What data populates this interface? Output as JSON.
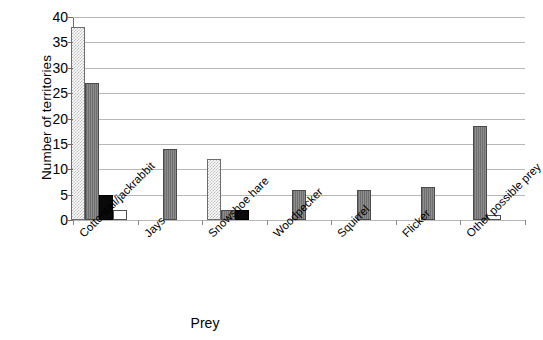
{
  "chart_data": {
    "type": "bar",
    "title": "",
    "subtitle": "",
    "xlabel": "Prey",
    "ylabel": "Number of territories",
    "ylim": [
      0,
      40
    ],
    "ytick_step": 5,
    "yticks": [
      40,
      35,
      30,
      25,
      20,
      15,
      10,
      5,
      0
    ],
    "grid": true,
    "legend": false,
    "legend_position": "none",
    "categories": [
      "Cottontail/jackrabbit",
      "Jays",
      "Snowshoe hare",
      "Woodpecker",
      "Squirrel",
      "Flicker",
      "Other possible prey"
    ],
    "series": [
      {
        "name": "series-1",
        "pattern": "light-stipple",
        "color": "#d0d0d0",
        "values": [
          38,
          null,
          12,
          null,
          null,
          null,
          null
        ]
      },
      {
        "name": "series-2",
        "pattern": "dark-gray",
        "color": "#7b7b7b",
        "values": [
          27,
          14,
          2,
          6,
          6,
          6.5,
          18.5
        ]
      },
      {
        "name": "series-3",
        "pattern": "black",
        "color": "#0a0a0a",
        "values": [
          5,
          null,
          2,
          null,
          null,
          null,
          null
        ]
      },
      {
        "name": "series-4",
        "pattern": "white",
        "color": "#ffffff",
        "values": [
          2,
          null,
          null,
          null,
          null,
          null,
          1
        ]
      }
    ],
    "bars": [
      {
        "category": "Cottontail/jackrabbit",
        "series": "series-1",
        "value": 38,
        "style": "light"
      },
      {
        "category": "Cottontail/jackrabbit",
        "series": "series-2",
        "value": 27,
        "style": "dark"
      },
      {
        "category": "Cottontail/jackrabbit",
        "series": "series-3",
        "value": 5,
        "style": "black"
      },
      {
        "category": "Cottontail/jackrabbit",
        "series": "series-4",
        "value": 2,
        "style": "white"
      },
      {
        "category": "Jays",
        "series": "series-2",
        "value": 14,
        "style": "dark"
      },
      {
        "category": "Snowshoe hare",
        "series": "series-1",
        "value": 12,
        "style": "light"
      },
      {
        "category": "Snowshoe hare",
        "series": "series-2",
        "value": 2,
        "style": "dark"
      },
      {
        "category": "Snowshoe hare",
        "series": "series-3",
        "value": 2,
        "style": "black"
      },
      {
        "category": "Woodpecker",
        "series": "series-2",
        "value": 6,
        "style": "dark"
      },
      {
        "category": "Squirrel",
        "series": "series-2",
        "value": 6,
        "style": "dark"
      },
      {
        "category": "Flicker",
        "series": "series-2",
        "value": 6.5,
        "style": "dark"
      },
      {
        "category": "Other possible prey",
        "series": "series-2",
        "value": 18.5,
        "style": "dark"
      },
      {
        "category": "Other possible prey",
        "series": "series-4",
        "value": 1,
        "style": "white"
      }
    ]
  },
  "axis": {
    "y_title": "Number of territories",
    "x_title": "Prey",
    "y_tick_labels": [
      "40",
      "35",
      "30",
      "25",
      "20",
      "15",
      "10",
      "5",
      "0"
    ],
    "x_tick_labels": [
      "Cottontail/jackrabbit",
      "Jays",
      "Snowshoe hare",
      "Woodpecker",
      "Squirrel",
      "Flicker",
      "Other possible prey"
    ]
  },
  "colors": {
    "gridline": "#b7b7b7",
    "axis": "#6b6b6b",
    "bar_light": "#d0d0d0",
    "bar_dark": "#7b7b7b",
    "bar_black": "#0a0a0a",
    "bar_white": "#ffffff",
    "background": "#ffffff",
    "text": "#000000"
  }
}
